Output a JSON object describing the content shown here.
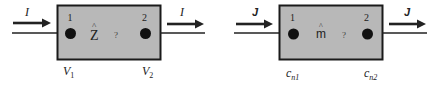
{
  "diagrams": [
    {
      "id": "impedance",
      "flow_symbol": "I",
      "operator_symbol": "Z",
      "operator_hat": "^",
      "question": "?",
      "port_labels": [
        "1",
        "2"
      ],
      "node_labels": [
        {
          "base": "V",
          "sub": "1"
        },
        {
          "base": "V",
          "sub": "2"
        }
      ]
    },
    {
      "id": "mass-transfer",
      "flow_symbol": "J",
      "operator_symbol": "m",
      "operator_hat": "^",
      "question": "?",
      "port_labels": [
        "1",
        "2"
      ],
      "node_labels": [
        {
          "base": "c",
          "sub": "n1"
        },
        {
          "base": "c",
          "sub": "n2"
        }
      ]
    }
  ],
  "colors": {
    "box_fill": "#b8b8b8",
    "box_stroke": "#1a1a1a",
    "dot": "#111111",
    "wire": "#222222",
    "text": "#222222"
  }
}
